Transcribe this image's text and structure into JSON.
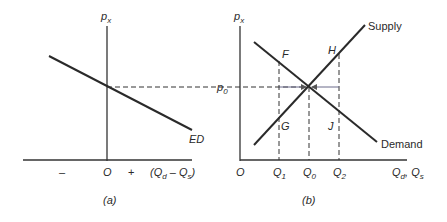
{
  "panel_a": {
    "caption": "(a)",
    "y_axis_label": "p",
    "y_axis_sub": "x",
    "origin_label": "O",
    "minus_label": "–",
    "plus_label": "+",
    "x_axis_label_open": "(Q",
    "x_axis_sub_d": "d",
    "x_axis_mid": " – Q",
    "x_axis_sub_s": "s",
    "x_axis_close": ")",
    "curve_label": "ED"
  },
  "panel_b": {
    "caption": "(b)",
    "y_axis_label": "p",
    "y_axis_sub": "x",
    "price_label": "p",
    "price_sub": "0",
    "origin_label": "O",
    "q1": "Q",
    "q1_sub": "1",
    "q0": "Q",
    "q0_sub": "0",
    "q2": "Q",
    "q2_sub": "2",
    "x_axis_q": "Q",
    "x_axis_sub_d": "d",
    "x_axis_sep": ", Q",
    "x_axis_sub_s": "s",
    "supply_label": "Supply",
    "demand_label": "Demand",
    "point_f": "F",
    "point_h": "H",
    "point_g": "G",
    "point_j": "J"
  },
  "colors": {
    "line": "#2a2a2a",
    "arrow": "#6a6a8a",
    "background": "#ffffff"
  }
}
